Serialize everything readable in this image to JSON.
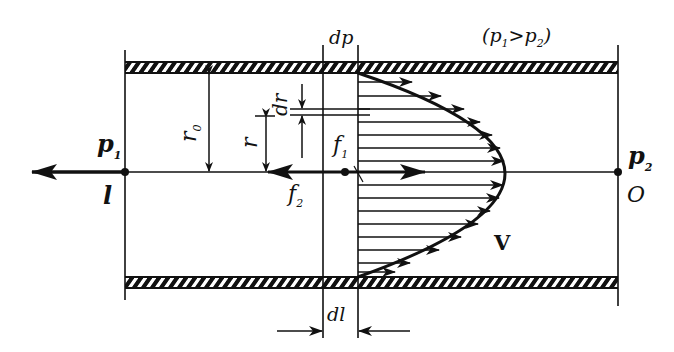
{
  "diagram": {
    "condition": {
      "open": "(",
      "p1": "p",
      "p1_sub": "1",
      "gt": ">",
      "p2": "p",
      "p2_sub": "2",
      "close": ")"
    },
    "labels": {
      "dp": "dp",
      "dl": "dl",
      "r0": "r",
      "r0_sub": "0",
      "r": "r",
      "dr": "dr",
      "f1": "f",
      "f1_sub": "1",
      "f2": "f",
      "f2_sub": "2",
      "p1": "p",
      "p1_sub": "1",
      "p2": "p",
      "p2_sub": "2",
      "l": "l",
      "O": "O",
      "V": "V"
    },
    "colors": {
      "ink": "#111111",
      "background": "#ffffff"
    },
    "velocity_profile": {
      "shape": "parabolic",
      "arrow_count": 15
    }
  }
}
